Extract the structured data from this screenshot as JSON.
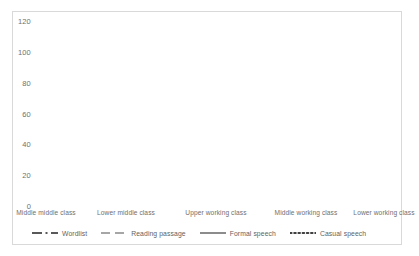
{
  "chart_data": {
    "type": "line",
    "title": "",
    "xlabel": "",
    "ylabel": "",
    "ylim": [
      0,
      120
    ],
    "yticks": [
      0,
      20,
      40,
      60,
      80,
      100,
      120
    ],
    "grid": false,
    "legend_position": "bottom",
    "categories": [
      "Middle middle class",
      "Lower middle class",
      "Upper working class",
      "Middle working class",
      "Lower working class"
    ],
    "series": [
      {
        "name": "Wordlist",
        "style": "dash-dot",
        "color": "#595959",
        "values": [
          0,
          1,
          6,
          26,
          31
        ]
      },
      {
        "name": "Reading passage",
        "style": "dashed",
        "color": "#a6a6a6",
        "values": [
          2,
          8,
          17,
          40,
          66
        ]
      },
      {
        "name": "Formal speech",
        "style": "solid",
        "color": "#7f7f7f",
        "values": [
          4,
          16,
          75,
          86,
          98
        ]
      },
      {
        "name": "Casual speech",
        "style": "dotted",
        "color": "#404040",
        "values": [
          28,
          40,
          88,
          95,
          100
        ]
      }
    ]
  },
  "axis": {
    "ytick_labels": [
      "120",
      "100",
      "80",
      "60",
      "40",
      "20",
      "0"
    ]
  },
  "legend": {
    "items": [
      {
        "label": "Wordlist"
      },
      {
        "label": "Reading passage"
      },
      {
        "label": "Formal speech"
      },
      {
        "label": "Casual speech"
      }
    ]
  }
}
